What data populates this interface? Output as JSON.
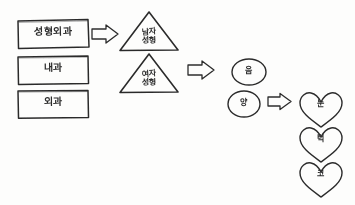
{
  "page": {
    "medium": "pencil sketch on white paper",
    "ink_color": "#2b2b2b",
    "paper_color": "#fdfdfc"
  },
  "boxes": [
    {
      "id": "box-plastic-surgery",
      "label": "성형외과",
      "x": 17,
      "y": 20,
      "w": 72,
      "h": 28,
      "rotate": -1.5
    },
    {
      "id": "box-internal-medicine",
      "label": "내과",
      "x": 17,
      "y": 56,
      "w": 72,
      "h": 28,
      "rotate": -0.8
    },
    {
      "id": "box-surgery",
      "label": "외과",
      "x": 17,
      "y": 90,
      "w": 72,
      "h": 28,
      "rotate": -0.5
    }
  ],
  "triangles": [
    {
      "id": "triangle-male-plastic",
      "line1": "남자",
      "line2": "성형",
      "x": 120,
      "y": 12,
      "w": 58,
      "h": 38
    },
    {
      "id": "triangle-female-plastic",
      "line1": "여자",
      "line2": "성형",
      "x": 120,
      "y": 54,
      "w": 58,
      "h": 38
    }
  ],
  "ellipses": [
    {
      "id": "ellipse-yin",
      "label": "음",
      "cx": 249,
      "cy": 72,
      "rx": 17,
      "ry": 13
    },
    {
      "id": "ellipse-yang",
      "label": "양",
      "cx": 244,
      "cy": 104,
      "rx": 16,
      "ry": 13
    }
  ],
  "hearts": [
    {
      "id": "heart-eye",
      "label": "눈",
      "cx": 321,
      "cy": 110,
      "w": 44,
      "h": 36
    },
    {
      "id": "heart-chin",
      "label": "턱",
      "cx": 321,
      "cy": 145,
      "w": 44,
      "h": 36
    },
    {
      "id": "heart-nose",
      "label": "코",
      "cx": 321,
      "cy": 180,
      "w": 44,
      "h": 36
    }
  ],
  "arrows": [
    {
      "id": "arrow-box-to-triangle",
      "x": 92,
      "y": 26,
      "w": 26,
      "h": 16,
      "direction": "right"
    },
    {
      "id": "arrow-triangle-to-ellipse",
      "x": 188,
      "y": 62,
      "w": 26,
      "h": 16,
      "direction": "right"
    },
    {
      "id": "arrow-ellipse-to-heart",
      "x": 268,
      "y": 95,
      "w": 24,
      "h": 15,
      "direction": "right"
    }
  ]
}
